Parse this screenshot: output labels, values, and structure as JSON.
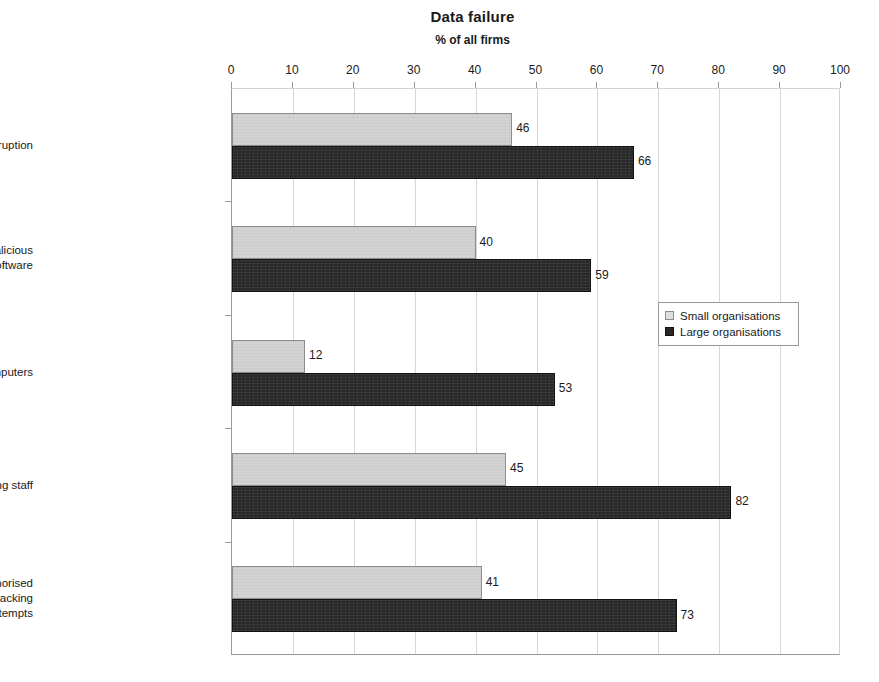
{
  "chart_data": {
    "type": "bar",
    "orientation": "horizontal",
    "title": "Data failure",
    "subtitle": "% of all firms",
    "xlabel": "",
    "ylabel": "",
    "xlim": [
      0,
      100
    ],
    "xticks": [
      0,
      10,
      20,
      30,
      40,
      50,
      60,
      70,
      80,
      90,
      100
    ],
    "xtick_labels": [
      "0",
      "10",
      "20",
      "30",
      "40",
      "50",
      "60",
      "70",
      "80",
      "90",
      "100"
    ],
    "grid": true,
    "grid_axis": "x",
    "legend_position": "right-middle",
    "categories": [
      "System failure or data corruption",
      "Infection by viruses or malicious software",
      "Theft or fraud involving computers",
      "Other incidents involving staff",
      "Attacks by an unauthorised outsider, including hacking attempts"
    ],
    "category_label_lines": [
      [
        "System failure or data corruption"
      ],
      [
        "Infection by viruses or malicious",
        "software"
      ],
      [
        "Theft or fraud involving computers"
      ],
      [
        "Other incidents involving staff"
      ],
      [
        "Attacks by an unauthorised",
        "outsider, including hacking",
        "attempts"
      ]
    ],
    "series": [
      {
        "name": "Small organisations",
        "color": "#d4d4d4",
        "values": [
          46,
          40,
          12,
          45,
          41
        ]
      },
      {
        "name": "Large organisations",
        "color": "#272727",
        "values": [
          66,
          59,
          53,
          82,
          73
        ]
      }
    ],
    "data_labels": [
      [
        "46",
        "66"
      ],
      [
        "40",
        "59"
      ],
      [
        "12",
        "53"
      ],
      [
        "45",
        "82"
      ],
      [
        "41",
        "73"
      ]
    ]
  },
  "legend": {
    "items": [
      {
        "label": "Small organisations",
        "swatch": "small"
      },
      {
        "label": "Large organisations",
        "swatch": "large"
      }
    ]
  },
  "colors": {
    "small_bar": "#d4d4d4",
    "large_bar": "#272727",
    "gridline": "#d6d6d6",
    "axis": "#9a9a9a",
    "text": "#1a1a1a",
    "background": "#ffffff"
  }
}
